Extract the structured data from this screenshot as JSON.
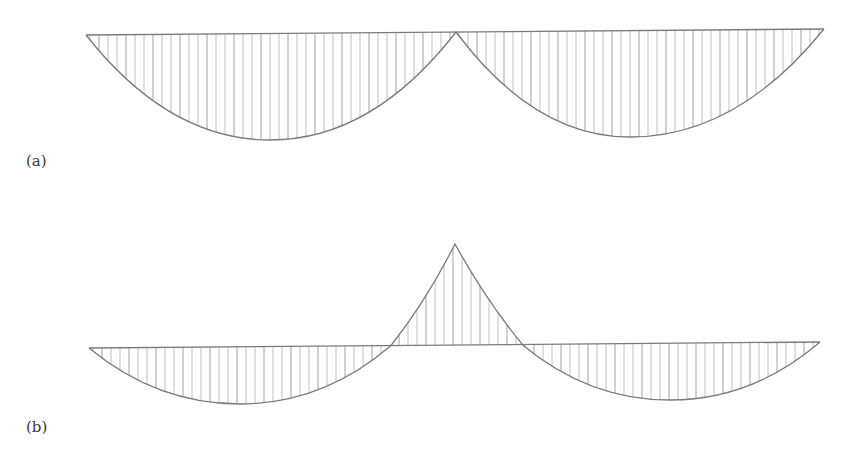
{
  "figure": {
    "panels": [
      {
        "id": "a",
        "label": "(a)",
        "description": "Two-span moment diagram, both lobes hanging below baseline, meeting at a cusp at the central support",
        "baseline": {
          "x1": 86,
          "y1": 35,
          "x2": 824,
          "y2": 29
        },
        "support_point": {
          "x": 456,
          "y": 32
        },
        "lobes": [
          {
            "from_x": 86,
            "to_x": 456,
            "bottom": {
              "x": 270,
              "y": 140
            }
          },
          {
            "from_x": 456,
            "to_x": 824,
            "bottom": {
              "x": 630,
              "y": 137
            }
          }
        ]
      },
      {
        "id": "b",
        "label": "(b)",
        "description": "Two-span moment diagram with sagging lobes and a hogging peak above the baseline over the central support",
        "baseline": {
          "x1": 89,
          "y1": 348,
          "x2": 820,
          "y2": 342
        },
        "zero_crossings": [
          {
            "x": 391,
            "y": 346
          },
          {
            "x": 522,
            "y": 344
          }
        ],
        "peak": {
          "x": 455,
          "y": 244
        },
        "lobes": [
          {
            "from_x": 89,
            "to_x": 391,
            "bottom": {
              "x": 240,
              "y": 404
            }
          },
          {
            "from_x": 522,
            "to_x": 820,
            "bottom": {
              "x": 670,
              "y": 400
            }
          }
        ]
      }
    ],
    "colors": {
      "outline": "#7a7a7a",
      "hatch": "#b0b0b0",
      "hatch_dark": "#8c8c8c",
      "label": "#3a3a3a",
      "background": "#ffffff"
    },
    "hatch_spacing_px": 9
  }
}
